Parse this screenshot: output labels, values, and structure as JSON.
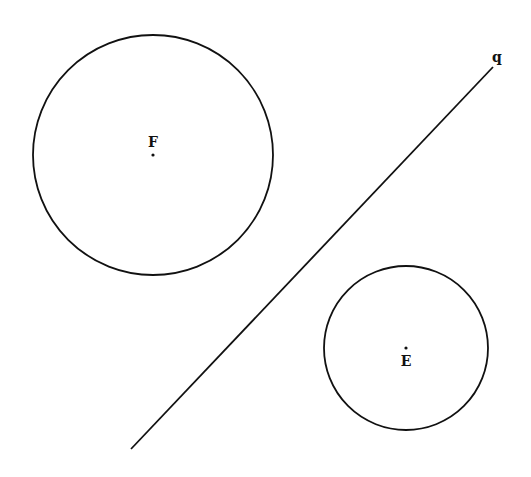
{
  "diagram": {
    "width": 531,
    "height": 477,
    "background": "#ffffff",
    "stroke_color": "#111111",
    "circles": [
      {
        "name": "circle-F",
        "label": "F",
        "center": [
          153,
          155
        ],
        "radius": 120,
        "label_pos": [
          153,
          147
        ]
      },
      {
        "name": "circle-E",
        "label": "E",
        "center": [
          406,
          348
        ],
        "radius": 82,
        "label_pos": [
          406,
          366
        ]
      }
    ],
    "lines": [
      {
        "name": "line-q",
        "label": "q",
        "from": [
          131,
          449
        ],
        "to": [
          493,
          67
        ],
        "label_pos": [
          497,
          62
        ]
      }
    ]
  }
}
